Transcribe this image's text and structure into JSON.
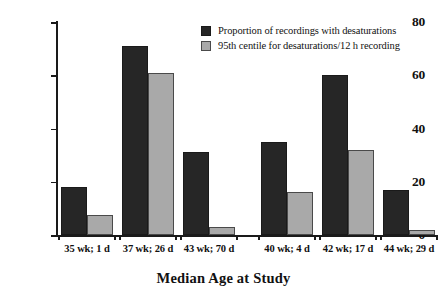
{
  "chart_data": {
    "type": "bar",
    "title": "",
    "xlabel": "Median Age at Study",
    "ylabel": "% Recordings // Desaturations/12h",
    "categories": [
      "35 wk; 1 d",
      "37 wk; 26 d",
      "43 wk; 70 d",
      "40 wk; 4 d",
      "42 wk; 17 d",
      "44 wk; 29 d"
    ],
    "series": [
      {
        "name": "Proportion of recordings with desaturations",
        "color": "#262626",
        "values": [
          18,
          71,
          31,
          35,
          60,
          17
        ]
      },
      {
        "name": "95th centile for desaturations/12 h recording",
        "color": "#a9a9a9",
        "values": [
          7.5,
          61,
          3,
          16,
          32,
          2
        ]
      }
    ],
    "ylim": [
      0,
      80
    ],
    "yticks": [
      0,
      20,
      40,
      60,
      80
    ],
    "ytick_labels": [
      "0",
      "20",
      "40",
      "60",
      "80"
    ],
    "grid": false,
    "legend_position": "top-center",
    "group_separator_after_index": 2
  },
  "legend": {
    "items": [
      {
        "label": "Proportion of recordings with desaturations",
        "swatch": "dark"
      },
      {
        "label": "95th centile for desaturations/12 h recording",
        "swatch": "light"
      }
    ]
  }
}
